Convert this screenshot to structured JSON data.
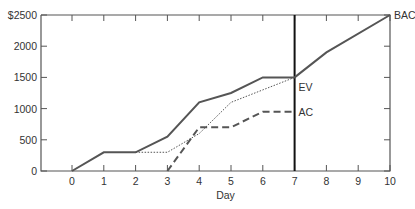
{
  "chart_data": {
    "type": "line",
    "title": "",
    "xlabel": "Day",
    "ylabel": "",
    "x": [
      0,
      1,
      2,
      3,
      4,
      5,
      6,
      7,
      8,
      9,
      10
    ],
    "x_ticks": [
      "0",
      "1",
      "2",
      "3",
      "4",
      "5",
      "6",
      "7",
      "8",
      "9",
      "10"
    ],
    "y_ticks": [
      "0",
      "500",
      "1000",
      "1500",
      "2000",
      "$2500"
    ],
    "xlim": [
      -1,
      10
    ],
    "ylim": [
      0,
      2500
    ],
    "grid": false,
    "series": [
      {
        "name": "BAC",
        "style": "solid",
        "points": [
          [
            0,
            0
          ],
          [
            1,
            300
          ],
          [
            2,
            300
          ],
          [
            3,
            550
          ],
          [
            4,
            1100
          ],
          [
            5,
            1250
          ],
          [
            6,
            1500
          ],
          [
            7,
            1500
          ],
          [
            8,
            1900
          ],
          [
            10,
            2500
          ]
        ]
      },
      {
        "name": "EV",
        "style": "dotted",
        "points": [
          [
            2,
            300
          ],
          [
            3,
            300
          ],
          [
            4,
            600
          ],
          [
            5,
            1100
          ],
          [
            6,
            1300
          ],
          [
            7,
            1500
          ]
        ]
      },
      {
        "name": "AC",
        "style": "dashed",
        "points": [
          [
            3,
            0
          ],
          [
            4,
            700
          ],
          [
            5,
            700
          ],
          [
            6,
            950
          ],
          [
            7,
            950
          ]
        ]
      }
    ],
    "annotations": [
      {
        "text": "BAC",
        "x": 10,
        "y": 2500
      },
      {
        "text": "EV",
        "x": 7,
        "y": 1350
      },
      {
        "text": "AC",
        "x": 7,
        "y": 950
      }
    ],
    "status_date_line": 7
  }
}
